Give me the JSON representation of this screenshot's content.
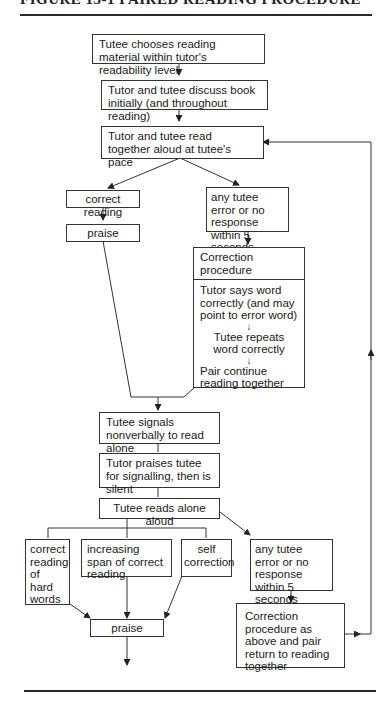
{
  "figure": {
    "title": "FIGURE 13-1  PAIRED READING PROCEDURE"
  },
  "nodes": {
    "choose": "Tutee chooses reading material within tutor's readability level",
    "discuss": "Tutor and tutee discuss book initially (and throughout reading)",
    "read_together": "Tutor and tutee read together aloud at tutee's pace",
    "correct_reading": "correct reading",
    "praise_1": "praise",
    "error_1": "any tutee error or no response within 5 seconds",
    "correction": {
      "heading": "Correction procedure",
      "step1": "Tutor says word correctly (and may point to error word)",
      "step2": "Tutee repeats word correctly",
      "step3": "Pair continue reading together"
    },
    "signal": "Tutee signals nonverbally to read alone",
    "tutor_praises": "Tutor praises tutee for signalling, then is silent",
    "read_alone": "Tutee reads alone aloud",
    "hard_words": "correct reading of hard words",
    "increasing_span": "increasing span of correct reading",
    "self_correction": "self correction",
    "error_2": "any tutee error or no response within 5 seconds",
    "praise_2": "praise",
    "correction_2": "Correction procedure as above and pair return to reading together"
  }
}
